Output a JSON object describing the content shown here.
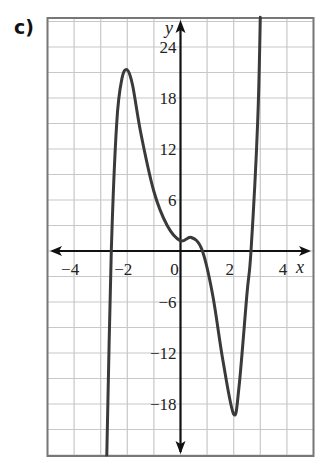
{
  "part_label": "c)",
  "chart_data": {
    "type": "line",
    "title": "",
    "xlabel": "x",
    "ylabel": "y",
    "xlim": [
      -5,
      5
    ],
    "ylim": [
      -24,
      27
    ],
    "grid": true,
    "x_grid_step": 1,
    "y_grid_step": 3,
    "x_ticks": [
      -4,
      -2,
      0,
      2,
      4
    ],
    "x_tick_labels": [
      "−4",
      "−2",
      "0",
      "2",
      "4"
    ],
    "y_ticks": [
      24,
      18,
      12,
      6,
      -6,
      -12,
      -18
    ],
    "y_tick_labels": [
      "24",
      "18",
      "12",
      "6",
      "−6",
      "−12",
      "−18"
    ],
    "series": [
      {
        "name": "f(x)",
        "color": "#3a3a3a",
        "x": [
          -2.77,
          -2.6,
          -2.4,
          -2.2,
          -2.0,
          -1.8,
          -1.5,
          -1.0,
          -0.5,
          0.0,
          0.4,
          0.8,
          1.2,
          1.6,
          2.0,
          2.2,
          2.5,
          2.65,
          2.9,
          3.0
        ],
        "y": [
          -24,
          0,
          15,
          20.3,
          21.3,
          19.5,
          14,
          7,
          3,
          1.2,
          1.6,
          0.2,
          -5,
          -13,
          -19.2,
          -16,
          -5,
          0,
          15,
          27.5
        ]
      }
    ],
    "annotations": {
      "local_max": [
        -2,
        21
      ],
      "local_min": [
        2,
        -19
      ],
      "roots_approx": [
        -2.6,
        0.8,
        2.65
      ]
    }
  }
}
